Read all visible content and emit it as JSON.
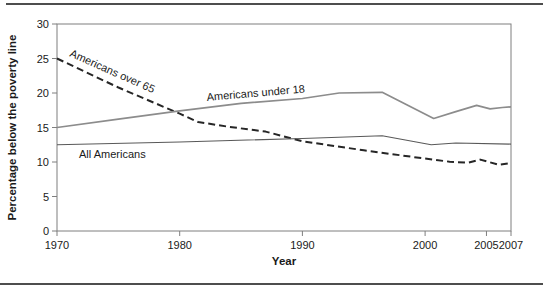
{
  "page": {
    "top_rule_color": "#4d4d4d",
    "bottom_rule_color": "#4d4d4d",
    "background": "#ffffff"
  },
  "chart_data": {
    "type": "line",
    "title": "",
    "xlabel": "Year",
    "ylabel": "Percentage below the poverty line",
    "xlim": [
      1970,
      2007
    ],
    "ylim": [
      0,
      30
    ],
    "x_ticks": [
      1970,
      1980,
      1990,
      2000,
      2005,
      2007
    ],
    "y_ticks": [
      0,
      5,
      10,
      15,
      20,
      25,
      30
    ],
    "grid": false,
    "frame": true,
    "frame_color": "#7f7f7f",
    "tick_label_color": "#1a1a1a",
    "series": [
      {
        "name": "Americans over 65",
        "style": "dashed",
        "color": "#262626",
        "width": 2,
        "points": [
          [
            1970,
            25
          ],
          [
            1975,
            20.8
          ],
          [
            1980,
            17
          ],
          [
            1981.5,
            15.8
          ],
          [
            1984,
            15.1
          ],
          [
            1987,
            14.4
          ],
          [
            1990,
            13
          ],
          [
            1995,
            11.7
          ],
          [
            2000,
            10.5
          ],
          [
            2002,
            10.05
          ],
          [
            2003.5,
            9.9
          ],
          [
            2004.5,
            10.35
          ],
          [
            2006,
            9.6
          ],
          [
            2007,
            9.85
          ]
        ]
      },
      {
        "name": "Americans under 18",
        "style": "solid",
        "color": "#8c8c8c",
        "width": 1.7,
        "points": [
          [
            1970,
            15
          ],
          [
            1975,
            16.2
          ],
          [
            1980,
            17.4
          ],
          [
            1985,
            18.5
          ],
          [
            1990,
            19.2
          ],
          [
            1993,
            20
          ],
          [
            1996.5,
            20.1
          ],
          [
            2000.7,
            16.3
          ],
          [
            2002.5,
            17.3
          ],
          [
            2004.2,
            18.2
          ],
          [
            2005.3,
            17.7
          ],
          [
            2006.3,
            17.9
          ],
          [
            2007,
            18
          ]
        ]
      },
      {
        "name": "All Americans",
        "style": "solid",
        "color": "#595959",
        "width": 1.1,
        "points": [
          [
            1970,
            12.5
          ],
          [
            1980,
            12.9
          ],
          [
            1990,
            13.4
          ],
          [
            1996.5,
            13.8
          ],
          [
            2000.5,
            12.5
          ],
          [
            2002.5,
            12.75
          ],
          [
            2007,
            12.6
          ]
        ]
      }
    ],
    "annotations": [
      {
        "text": "Americans over 65",
        "x": 69,
        "y": 56,
        "rotate": 24
      },
      {
        "text": "Americans under 18",
        "x": 207,
        "y": 101,
        "rotate": -5
      },
      {
        "text": "All Americans",
        "x": 79,
        "y": 158,
        "rotate": 0
      }
    ],
    "legend_position": "inline-labels"
  }
}
